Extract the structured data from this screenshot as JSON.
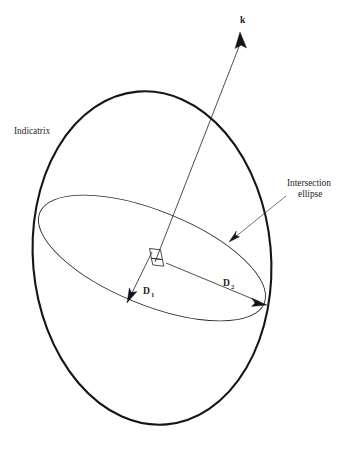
{
  "figure": {
    "background_color": "#ffffff",
    "stroke_color": "#161616",
    "labels": {
      "indicatrix": "Indicatrix",
      "intersection_line1": "Intersection",
      "intersection_line2": "ellipse",
      "wave_vector": "k",
      "d1_base": "D",
      "d1_sub": "1",
      "d2_base": "D",
      "d2_sub": "2"
    },
    "geometry": {
      "outer_ellipse": {
        "center_x": 152,
        "center_y": 258,
        "rx": 119,
        "ry": 167,
        "rotation_deg": -5
      },
      "intersection_ellipse": {
        "center_x": 152,
        "center_y": 258,
        "rx": 121,
        "ry": 47,
        "rotation_deg": 22
      },
      "wave_vector_arrow": {
        "x1": 155,
        "y1": 262,
        "x2": 240,
        "y2": 33
      },
      "d1_arrow": {
        "x1": 152,
        "y1": 252,
        "x2": 128,
        "y2": 302
      },
      "d2_arrow": {
        "x1": 166,
        "y1": 263,
        "x2": 266,
        "y2": 305
      },
      "right_angle_marker": {
        "x": 152,
        "y": 252
      },
      "intersection_leader": {
        "x1": 285,
        "y1": 197,
        "x2": 230,
        "y2": 241
      }
    }
  }
}
